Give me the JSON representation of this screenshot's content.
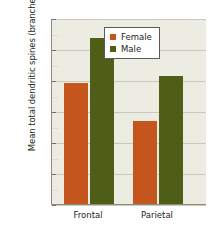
{
  "chart_data": {
    "type": "bar",
    "title": "",
    "xlabel": "",
    "ylabel": "Mean total dendritic spines (branches)",
    "categories": [
      "Frontal",
      "Parietal"
    ],
    "series": [
      {
        "name": "Female",
        "color": "#c4551c",
        "values": [
          19.5,
          13.4
        ]
      },
      {
        "name": "Male",
        "color": "#4f5e17",
        "values": [
          26.8,
          20.6
        ]
      }
    ],
    "ylim": [
      0,
      30
    ],
    "yticks": [
      0,
      5,
      10,
      15,
      20,
      25,
      30
    ],
    "ytick_labels": [
      "0",
      "5",
      "10",
      "15",
      "20",
      "25",
      "30"
    ],
    "grid": true,
    "legend_position": "top-right",
    "legend_entries": [
      "Female",
      "Male"
    ],
    "plot_background": "#edece3",
    "figure_background": "#ffffff"
  }
}
